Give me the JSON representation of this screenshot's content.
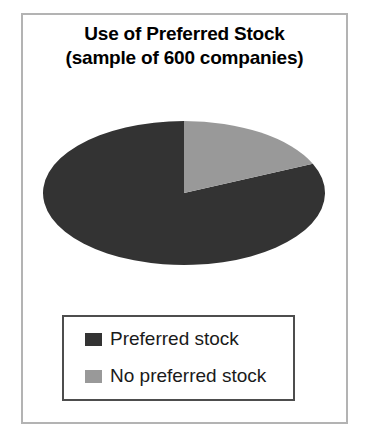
{
  "chart_data": {
    "type": "pie",
    "title": "Use of Preferred Stock (sample of 600 companies)",
    "title_lines": [
      "Use of Preferred Stock",
      "(sample of 600 companies)"
    ],
    "categories": [
      "Preferred stock",
      "No preferred stock"
    ],
    "values": [
      82,
      18
    ],
    "value_unit": "percent",
    "counts": [
      492,
      108
    ],
    "sample_size": 600,
    "colors": [
      "#333333",
      "#999999"
    ],
    "legend_position": "bottom",
    "start_angle_deg": 0,
    "direction": "clockwise",
    "grid": false,
    "xlabel": "",
    "ylabel": "",
    "slices": [
      {
        "label": "Preferred stock",
        "value": 82,
        "color": "#333333",
        "start_deg": 66,
        "end_deg": 360
      },
      {
        "label": "No preferred stock",
        "value": 18,
        "color": "#999999",
        "start_deg": 0,
        "end_deg": 66
      }
    ]
  },
  "figure": {
    "frame_color": "#b3b3b3",
    "background": "#ffffff",
    "legend_border_color": "#4d4d4d"
  },
  "geometry": {
    "center_x": 160,
    "center_y": 93,
    "radius_x": 141,
    "radius_y": 72
  }
}
